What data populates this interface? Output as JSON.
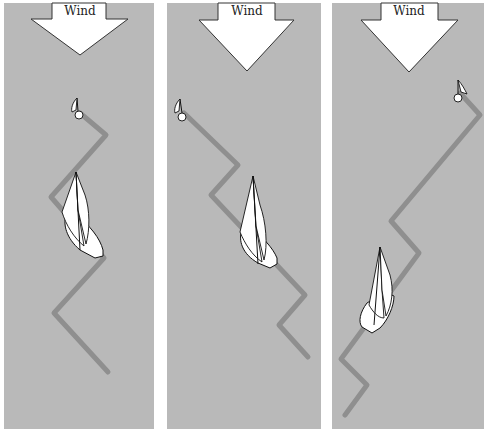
{
  "figure": {
    "colors": {
      "panel_background": "#b9b9b9",
      "track": "#8f8f8f",
      "arrow_fill": "#ffffff",
      "outline": "#111111"
    },
    "panels": [
      {
        "id": 1,
        "wind_label": "Wind",
        "arrow_icon": "down-arrow",
        "buoy_icon": "mark-buoy-flag",
        "boat_icon": "sailboat",
        "track_points": [
          [
            80,
            113
          ],
          [
            106,
            135
          ],
          [
            51,
            197
          ],
          [
            104,
            258
          ],
          [
            54,
            313
          ],
          [
            108,
            372
          ]
        ]
      },
      {
        "id": 2,
        "wind_label": "Wind",
        "arrow_icon": "down-arrow",
        "buoy_icon": "mark-buoy-flag",
        "boat_icon": "sailboat",
        "track_points": [
          [
            184,
            113
          ],
          [
            238,
            165
          ],
          [
            211,
            195
          ],
          [
            305,
            295
          ],
          [
            279,
            325
          ],
          [
            308,
            357
          ]
        ]
      },
      {
        "id": 3,
        "wind_label": "Wind",
        "arrow_icon": "down-arrow",
        "buoy_icon": "mark-buoy-flag",
        "boat_icon": "sailboat",
        "track_points": [
          [
            460,
            93
          ],
          [
            480,
            115
          ],
          [
            391,
            221
          ],
          [
            419,
            253
          ],
          [
            341,
            359
          ],
          [
            367,
            385
          ],
          [
            345,
            415
          ]
        ]
      }
    ]
  }
}
